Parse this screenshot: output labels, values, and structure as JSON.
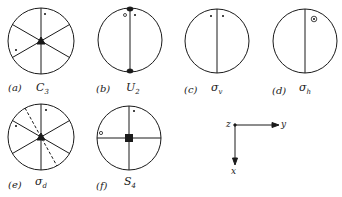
{
  "figure": {
    "panels": [
      {
        "id": "a",
        "label": "(a)",
        "symbol": "C",
        "sub": "3",
        "description": "three-fold rotation axis: six radial lines, filled triangle at center, two crosses"
      },
      {
        "id": "b",
        "label": "(b)",
        "symbol": "U",
        "sub": "2",
        "description": "two-fold axis in plane: vertical diameter with filled ellipses at ends, one circle and one cross"
      },
      {
        "id": "c",
        "label": "(c)",
        "symbol": "σ",
        "sub": "v",
        "description": "vertical mirror plane: vertical diameter, two crosses"
      },
      {
        "id": "d",
        "label": "(d)",
        "symbol": "σ",
        "sub": "h",
        "description": "horizontal mirror plane: vertical line, circled cross"
      },
      {
        "id": "e",
        "label": "(e)",
        "symbol": "σ",
        "sub": "d",
        "description": "diagonal mirror plane: six radial lines, dashed diagonal, filled triangle, two crosses"
      },
      {
        "id": "f",
        "label": "(f)",
        "symbol": "S",
        "sub": "4",
        "description": "four-fold improper rotation: cross lines, filled square, one cross and one circle"
      }
    ],
    "axes": {
      "origin_label": "z",
      "horizontal_label": "y",
      "vertical_label": "x"
    },
    "colors": {
      "ink": "#1a1a1a",
      "background": "#ffffff"
    }
  }
}
